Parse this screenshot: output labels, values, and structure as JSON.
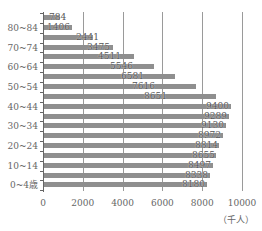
{
  "chart_data": {
    "type": "bar",
    "orientation": "horizontal",
    "title": "",
    "xlabel": "",
    "ylabel": "",
    "unit_label": "（千人）",
    "xlim": [
      0,
      10000
    ],
    "x_ticks": [
      "0",
      "2000",
      "4000",
      "6000",
      "8000",
      "10000"
    ],
    "grid": true,
    "categories": [
      "85以上",
      "80~84",
      "75~79",
      "70~74",
      "65~69",
      "60~64",
      "55~59",
      "50~54",
      "45~49",
      "40~44",
      "35~39",
      "30~34",
      "25~29",
      "20~24",
      "15~19",
      "10~14",
      "5~9",
      "0~4歳"
    ],
    "visible_category_labels": [
      "80~84",
      "70~74",
      "60~64",
      "50~54",
      "40~44",
      "30~34",
      "20~24",
      "10~14",
      "0~4歳"
    ],
    "values": [
      784,
      1406,
      2441,
      3475,
      4511,
      5546,
      6581,
      7616,
      8651,
      9400,
      9289,
      9130,
      8972,
      8814,
      8655,
      8497,
      8338,
      8180
    ],
    "value_labels": [
      "784",
      "1406",
      "2441",
      "3475",
      "4511",
      "5546",
      "6581",
      "7616",
      "8651",
      "9400",
      "9289",
      "9130",
      "8972",
      "8814",
      "8655",
      "8497",
      "8338",
      "8180"
    ],
    "bar_color": "#8f8f8f"
  }
}
